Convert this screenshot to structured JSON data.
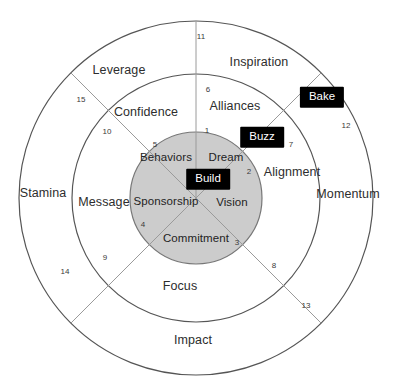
{
  "diagram": {
    "colors": {
      "inner_fill": "#cccccc",
      "ring_stroke": "#555555",
      "spoke_stroke": "#9a9a9a",
      "chip_bg": "#000000",
      "chip_text": "#ffffff",
      "page_bg": "#ffffff"
    },
    "geometry": {
      "center_x": 196,
      "center_y": 198,
      "inner_radius": 66,
      "middle_radius": 124,
      "outer_radius": 177
    },
    "core_labels": [
      {
        "text": "Dream",
        "x": 226,
        "y": 158
      },
      {
        "text": "Behaviors",
        "x": 166,
        "y": 158
      },
      {
        "text": "Sponsorship",
        "x": 166,
        "y": 202
      },
      {
        "text": "Vision",
        "x": 232,
        "y": 203
      },
      {
        "text": "Commitment",
        "x": 196,
        "y": 239
      }
    ],
    "middle_ring_labels": [
      {
        "text": "Confidence",
        "x": 146,
        "y": 112
      },
      {
        "text": "Alliances",
        "x": 235,
        "y": 106
      },
      {
        "text": "Alignment",
        "x": 292,
        "y": 172
      },
      {
        "text": "Message",
        "x": 104,
        "y": 202
      },
      {
        "text": "Focus",
        "x": 180,
        "y": 286
      }
    ],
    "outer_ring_labels": [
      {
        "text": "Leverage",
        "x": 119,
        "y": 70
      },
      {
        "text": "Inspiration",
        "x": 259,
        "y": 62
      },
      {
        "text": "Momentum",
        "x": 348,
        "y": 194
      },
      {
        "text": "Stamina",
        "x": 43,
        "y": 193
      },
      {
        "text": "Impact",
        "x": 193,
        "y": 340
      }
    ],
    "number_labels": [
      {
        "text": "1",
        "x": 207,
        "y": 131
      },
      {
        "text": "2",
        "x": 249,
        "y": 172
      },
      {
        "text": "3",
        "x": 237,
        "y": 243
      },
      {
        "text": "4",
        "x": 143,
        "y": 225
      },
      {
        "text": "5",
        "x": 155,
        "y": 145
      },
      {
        "text": "6",
        "x": 208,
        "y": 90
      },
      {
        "text": "7",
        "x": 291,
        "y": 145
      },
      {
        "text": "8",
        "x": 274,
        "y": 266
      },
      {
        "text": "9",
        "x": 105,
        "y": 258
      },
      {
        "text": "10",
        "x": 107,
        "y": 132
      },
      {
        "text": "11",
        "x": 201,
        "y": 37
      },
      {
        "text": "12",
        "x": 346,
        "y": 126
      },
      {
        "text": "13",
        "x": 306,
        "y": 306
      },
      {
        "text": "14",
        "x": 65,
        "y": 272
      },
      {
        "text": "15",
        "x": 81,
        "y": 100
      }
    ],
    "chips": [
      {
        "text": "Bake",
        "x": 322,
        "y": 97
      },
      {
        "text": "Buzz",
        "x": 262,
        "y": 137
      },
      {
        "text": "Build",
        "x": 208,
        "y": 179
      }
    ]
  }
}
